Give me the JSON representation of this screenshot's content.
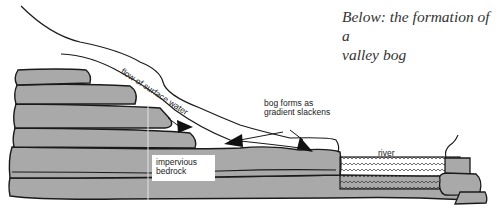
{
  "caption": {
    "line1": "Below: the formation of a",
    "line2": "valley bog"
  },
  "labels": {
    "flow": "flow of surface water",
    "bog_line1": "bog forms as",
    "bog_line2": "gradient slackens",
    "river": "river",
    "bedrock_line1": "impervious",
    "bedrock_line2": "bedrock"
  },
  "colors": {
    "rock": "#a9a9a9",
    "outline": "#1a1a1a",
    "background": "#ffffff",
    "text": "#222222"
  }
}
